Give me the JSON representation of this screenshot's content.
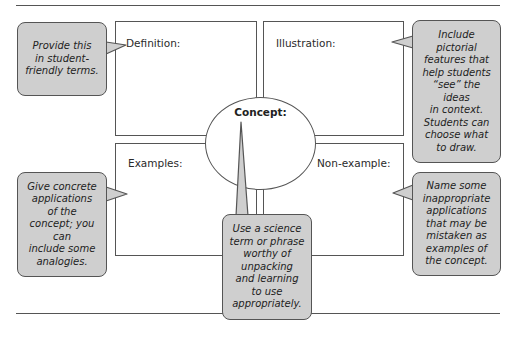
{
  "diagram": {
    "type": "concept-map (Frayer model)",
    "center": {
      "label": "Concept:"
    },
    "quadrants": [
      {
        "id": "definition",
        "label": "Definition:"
      },
      {
        "id": "illustration",
        "label": "Illustration:"
      },
      {
        "id": "examples",
        "label": "Examples:"
      },
      {
        "id": "non_example",
        "label": "Non-example:"
      }
    ],
    "callouts": {
      "definition": "Provide this\nin student-\nfriendly terms.",
      "illustration": "Include\npictorial\nfeatures that\nhelp students\n“see” the\nideas\nin context.\nStudents can\nchoose what\nto draw.",
      "examples": "Give concrete\napplications\nof the\nconcept; you\ncan\ninclude some\nanalogies.",
      "concept": "Use a science\nterm or phrase\nworthy of\nunpacking\nand learning\nto use\nappropriately.",
      "non_example": "Name some\ninappropriate\napplications\nthat may be\nmistaken as\nexamples of\nthe concept."
    },
    "colors": {
      "callout_fill": "#cfcfcf",
      "stroke": "#555555",
      "background": "#ffffff"
    }
  }
}
